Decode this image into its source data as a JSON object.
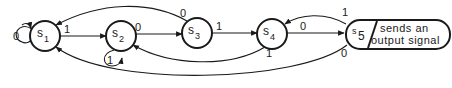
{
  "diagram": {
    "type": "finite-state-machine",
    "states": [
      {
        "id": "s1",
        "letter": "s",
        "index": "1"
      },
      {
        "id": "s2",
        "letter": "s",
        "index": "2"
      },
      {
        "id": "s3",
        "letter": "s",
        "index": "3"
      },
      {
        "id": "s4",
        "letter": "s",
        "index": "4"
      },
      {
        "id": "s5",
        "letter": "s",
        "index": "5",
        "note_line1": "sends an",
        "note_line2": "output signal"
      }
    ],
    "transitions": [
      {
        "from": "s1",
        "to": "s1",
        "label": "0"
      },
      {
        "from": "s1",
        "to": "s2",
        "label": "1"
      },
      {
        "from": "s2",
        "to": "s2",
        "label": "1"
      },
      {
        "from": "s2",
        "to": "s3",
        "label": "0"
      },
      {
        "from": "s3",
        "to": "s1",
        "label": "0"
      },
      {
        "from": "s3",
        "to": "s4",
        "label": "1"
      },
      {
        "from": "s4",
        "to": "s2",
        "label": "1"
      },
      {
        "from": "s4",
        "to": "s5",
        "label": "0"
      },
      {
        "from": "s5",
        "to": "s4",
        "label": "1"
      },
      {
        "from": "s5",
        "to": "s1",
        "label": "0"
      }
    ],
    "stroke_color": "#1a1a1a",
    "background": "#ffffff"
  }
}
